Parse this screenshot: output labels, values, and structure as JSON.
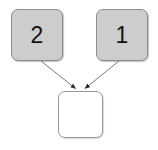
{
  "diagram": {
    "type": "flow-diagram",
    "background_color": "#ffffff",
    "nodes": [
      {
        "id": "node-two",
        "label": "2",
        "shape": "rounded-rectangle",
        "fill_color": "#cdcdcd",
        "border_color": "#8d8d8d",
        "text_color": "#111111",
        "x": 11,
        "y": 9,
        "width": 52,
        "height": 52
      },
      {
        "id": "node-one",
        "label": "1",
        "shape": "rounded-rectangle",
        "fill_color": "#cdcdcd",
        "border_color": "#8d8d8d",
        "text_color": "#111111",
        "x": 96,
        "y": 9,
        "width": 52,
        "height": 52
      },
      {
        "id": "node-target",
        "label": "",
        "shape": "rounded-rectangle",
        "fill_color": "#ffffff",
        "border_color": "#9a9a9a",
        "text_color": "#111111",
        "x": 58,
        "y": 91,
        "width": 45,
        "height": 47
      }
    ],
    "edges": [
      {
        "id": "edge-two-to-target",
        "from": "node-two",
        "to": "node-target",
        "from_point": [
          41,
          61
        ],
        "to_point": [
          76,
          89
        ],
        "arrowhead": "filled-triangle",
        "color": "#555555"
      },
      {
        "id": "edge-one-to-target",
        "from": "node-one",
        "to": "node-target",
        "from_point": [
          119,
          61
        ],
        "to_point": [
          85,
          89
        ],
        "arrowhead": "filled-triangle",
        "color": "#555555"
      }
    ]
  }
}
